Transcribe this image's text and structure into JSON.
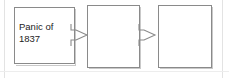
{
  "diagram": {
    "type": "flowchart",
    "orientation": "left-to-right",
    "background_color": "#ffffff",
    "node_border_color": "#8a8a8a",
    "node_fill_color": "#ffffff",
    "text_color": "#1c1c1c",
    "connector_color": "#8a8a8a",
    "nodes": [
      {
        "id": "node-1",
        "label": "Panic of\n1837",
        "filled": true
      },
      {
        "id": "node-2",
        "label": "",
        "filled": false
      },
      {
        "id": "node-3",
        "label": "",
        "filled": false
      }
    ],
    "connectors": [
      {
        "id": "connector-1",
        "from": "node-1",
        "to": "node-2",
        "icon": "right-arrow-icon"
      },
      {
        "id": "connector-2",
        "from": "node-2",
        "to": "node-3",
        "icon": "right-arrow-icon"
      }
    ]
  }
}
